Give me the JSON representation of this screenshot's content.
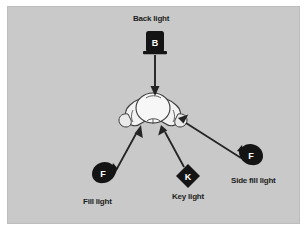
{
  "figure": {
    "panel_color": "#c9c9c9",
    "page_color": "#ffffff",
    "ink_color": "#1d1d1d",
    "subject_fill": "#f2f2f2"
  },
  "subject": {
    "name": "subject-head-top-view",
    "x": 153,
    "y": 110
  },
  "lights": [
    {
      "id": "back-light",
      "label": "Back light",
      "glyph": "B",
      "fixture": "square-lamp",
      "x": 155,
      "y": 42,
      "label_x": 133,
      "label_y": 14,
      "arrow": {
        "x1": 155,
        "y1": 55,
        "x2": 155,
        "y2": 94
      }
    },
    {
      "id": "fill-light",
      "label": "Fill light",
      "glyph": "F",
      "fixture": "teardrop-right",
      "x": 103,
      "y": 182,
      "label_x": 83,
      "label_y": 197,
      "arrow": {
        "x1": 114,
        "y1": 173,
        "x2": 141,
        "y2": 126
      }
    },
    {
      "id": "key-light",
      "label": "Key light",
      "glyph": "K",
      "fixture": "diamond-lamp",
      "x": 188,
      "y": 176,
      "label_x": 172,
      "label_y": 192,
      "arrow": {
        "x1": 184,
        "y1": 166,
        "x2": 161,
        "y2": 126
      }
    },
    {
      "id": "side-fill-light",
      "label": "Side fill light",
      "glyph": "F",
      "fixture": "teardrop-left",
      "x": 248,
      "y": 164,
      "label_x": 231,
      "label_y": 176,
      "arrow": {
        "x1": 240,
        "y1": 157,
        "x2": 178,
        "y2": 118
      }
    }
  ]
}
